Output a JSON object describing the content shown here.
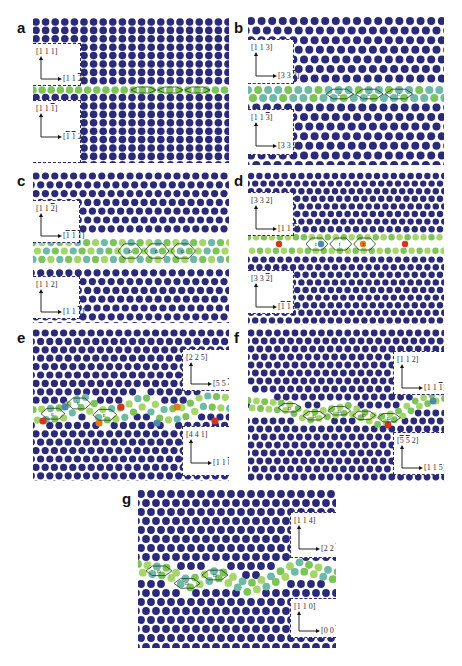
{
  "figure": {
    "colors": {
      "bulk_atom": "#2a2a78",
      "boundary_green": "#7cc35a",
      "boundary_lightgreen": "#a6d66a",
      "boundary_teal": "#6fb9a8",
      "boundary_blue": "#4f86b8",
      "boundary_red": "#d8341f",
      "boundary_orange": "#e07a1c",
      "unit_outline": "#1d3b1a",
      "box_border": "#2b2a6e",
      "background": "#ffffff"
    },
    "panels": [
      {
        "id": "a",
        "letter": "a",
        "rect": {
          "x": 33,
          "y": 18,
          "w": 196,
          "h": 145
        },
        "letter_pos": {
          "x": 17,
          "y": 20
        },
        "lattice": {
          "dx": 9.6,
          "dy": 8.4,
          "r": 3.8,
          "stagger": false,
          "angle": 0
        },
        "band": {
          "points": [
            [
              0,
              72
            ],
            [
              196,
              72
            ]
          ],
          "width": 8,
          "rows": 1,
          "palette": [
            "boundary_green"
          ],
          "accents": []
        },
        "units": {
          "count": 3,
          "start": 98,
          "label": ""
        },
        "boxes": [
          {
            "x": 0,
            "y": 25,
            "w": 48,
            "h": 43,
            "pos": "left",
            "y_label": "[1 1 1]",
            "x_label_parts": [
              "[1 1 ",
              "2",
              "]"
            ],
            "x_bar": [
              1
            ]
          },
          {
            "x": 0,
            "y": 82,
            "w": 48,
            "h": 63,
            "pos": "left",
            "y_label_parts": [
              "[1 1 ",
              "1",
              "]"
            ],
            "y_bar": [
              1
            ],
            "x_label_parts": [
              "[",
              "1",
              " ",
              "1",
              " 2]"
            ],
            "x_bar": [
              1,
              3
            ]
          }
        ]
      },
      {
        "id": "b",
        "letter": "b",
        "rect": {
          "x": 248,
          "y": 17,
          "w": 196,
          "h": 148
        },
        "letter_pos": {
          "x": 234,
          "y": 20
        },
        "lattice": {
          "dx": 10.6,
          "dy": 9.6,
          "r": 4.0,
          "stagger": true,
          "angle": 0
        },
        "band": {
          "points": [
            [
              0,
              77
            ],
            [
              196,
              77
            ]
          ],
          "width": 16,
          "rows": 2,
          "palette": [
            "boundary_teal",
            "boundary_green",
            "boundary_teal"
          ],
          "accents": []
        },
        "units": {
          "count": 3,
          "start": 78,
          "label": "C"
        },
        "boxes": [
          {
            "x": 0,
            "y": 22,
            "w": 46,
            "h": 45,
            "pos": "left",
            "y_label": "[1 1 3]",
            "x_label_parts": [
              "[3 3 ",
              "2",
              "]"
            ],
            "x_bar": [
              1
            ]
          },
          {
            "x": 0,
            "y": 92,
            "w": 46,
            "h": 46,
            "pos": "left",
            "y_label_parts": [
              "[1 1 ",
              "3",
              "]"
            ],
            "y_bar": [
              1
            ],
            "x_label": "[3 3 2]"
          }
        ]
      },
      {
        "id": "c",
        "letter": "c",
        "rect": {
          "x": 33,
          "y": 172,
          "w": 196,
          "h": 151
        },
        "letter_pos": {
          "x": 17,
          "y": 173
        },
        "lattice": {
          "dx": 9.4,
          "dy": 8.8,
          "r": 3.6,
          "stagger": true,
          "angle": 0
        },
        "band": {
          "points": [
            [
              0,
              79
            ],
            [
              196,
              79
            ]
          ],
          "width": 24,
          "rows": 3,
          "palette": [
            "boundary_green",
            "boundary_lightgreen",
            "boundary_teal"
          ],
          "accents": []
        },
        "units": {
          "count": 3,
          "start": 85,
          "label": "D"
        },
        "boxes": [
          {
            "x": 0,
            "y": 28,
            "w": 47,
            "h": 43,
            "pos": "left",
            "y_label_parts": [
              "[1 1 ",
              "2",
              "]"
            ],
            "y_bar": [
              1
            ],
            "x_label_parts": [
              "[",
              "1",
              " ",
              "1",
              " ",
              "1",
              "]"
            ],
            "x_bar": [
              1,
              3,
              5
            ]
          },
          {
            "x": 0,
            "y": 104,
            "w": 47,
            "h": 43,
            "pos": "left",
            "y_label": "[1 1 2]",
            "x_label_parts": [
              "[1 1 ",
              "1",
              "]"
            ],
            "x_bar": [
              1
            ]
          }
        ]
      },
      {
        "id": "d",
        "letter": "d",
        "rect": {
          "x": 248,
          "y": 172,
          "w": 196,
          "h": 153
        },
        "letter_pos": {
          "x": 234,
          "y": 173
        },
        "lattice": {
          "dx": 8.4,
          "dy": 7.6,
          "r": 3.2,
          "stagger": true,
          "angle": 0
        },
        "band": {
          "points": [
            [
              0,
              72
            ],
            [
              196,
              72
            ]
          ],
          "width": 20,
          "rows": 2,
          "palette": [
            "boundary_green",
            "boundary_lightgreen"
          ],
          "accents": [
            [
              31,
              72
            ],
            [
              73,
              72
            ],
            [
              115,
              72
            ],
            [
              157,
              72
            ]
          ]
        },
        "units": {
          "count": 3,
          "start": 58,
          "label": "I"
        },
        "boxes": [
          {
            "x": 0,
            "y": 20,
            "w": 46,
            "h": 44,
            "pos": "left",
            "y_label": "[3 3 2]",
            "x_label_parts": [
              "[1 1 ",
              "3",
              "]"
            ],
            "x_bar": [
              1
            ]
          },
          {
            "x": 0,
            "y": 98,
            "w": 46,
            "h": 44,
            "pos": "left",
            "y_label_parts": [
              "[3 3 ",
              "2",
              "]"
            ],
            "y_bar": [
              1
            ],
            "x_label_parts": [
              "[",
              "1",
              " ",
              "1",
              " 3]"
            ],
            "x_bar": [
              1,
              3
            ]
          }
        ]
      },
      {
        "id": "e",
        "letter": "e",
        "rect": {
          "x": 33,
          "y": 329,
          "w": 196,
          "h": 152
        },
        "letter_pos": {
          "x": 17,
          "y": 330
        },
        "lattice": {
          "dx": 9.2,
          "dy": 8.4,
          "r": 3.6,
          "stagger": true,
          "angle": 0
        },
        "band": {
          "points": [
            [
              0,
              86
            ],
            [
              30,
              84
            ],
            [
              50,
              72
            ],
            [
              70,
              86
            ],
            [
              90,
              84
            ],
            [
              110,
              72
            ],
            [
              130,
              86
            ],
            [
              150,
              84
            ],
            [
              170,
              72
            ],
            [
              196,
              74
            ]
          ],
          "width": 18,
          "rows": 2,
          "palette": [
            "boundary_green",
            "boundary_lightgreen",
            "boundary_teal"
          ],
          "accents": [
            [
              10,
              92
            ],
            [
              32,
              78
            ],
            [
              66,
              94
            ],
            [
              88,
              78
            ],
            [
              124,
              94
            ],
            [
              144,
              78
            ],
            [
              182,
              92
            ]
          ]
        },
        "units": {
          "count": 3,
          "start": 8,
          "label": "E"
        },
        "boxes": [
          {
            "x": 149,
            "y": 20,
            "w": 47,
            "h": 42,
            "pos": "right",
            "y_label": "[2 2 5]",
            "x_label_parts": [
              "[5 5 ",
              "4",
              "]"
            ],
            "x_bar": [
              1
            ]
          },
          {
            "x": 149,
            "y": 97,
            "w": 47,
            "h": 50,
            "pos": "right",
            "y_label": "[4 4 1]",
            "x_label_parts": [
              "[1 1 ",
              "8",
              "]"
            ],
            "x_bar": [
              1
            ]
          }
        ]
      },
      {
        "id": "f",
        "letter": "f",
        "rect": {
          "x": 248,
          "y": 329,
          "w": 196,
          "h": 152
        },
        "letter_pos": {
          "x": 234,
          "y": 330
        },
        "lattice": {
          "dx": 8.8,
          "dy": 8.0,
          "r": 3.4,
          "stagger": true,
          "angle": 0
        },
        "band": {
          "points": [
            [
              0,
              75
            ],
            [
              40,
              78
            ],
            [
              60,
              88
            ],
            [
              100,
              80
            ],
            [
              130,
              92
            ],
            [
              150,
              86
            ],
            [
              170,
              74
            ],
            [
              196,
              66
            ]
          ],
          "width": 14,
          "rows": 2,
          "palette": [
            "boundary_green",
            "boundary_lightgreen"
          ],
          "accents": [
            [
              140,
              96
            ],
            [
              185,
              72
            ],
            [
              188,
              52
            ]
          ]
        },
        "units": {
          "count": 5,
          "start": 30,
          "label": "D"
        },
        "boxes": [
          {
            "x": 145,
            "y": 22,
            "w": 51,
            "h": 44,
            "pos": "right",
            "y_label": "[1 1 2]",
            "x_label_parts": [
              "[1 1 ",
              "1",
              "]"
            ],
            "x_bar": [
              1
            ]
          },
          {
            "x": 145,
            "y": 103,
            "w": 51,
            "h": 43,
            "pos": "right",
            "y_label_parts": [
              "[",
              "5",
              " ",
              "5",
              " 2]"
            ],
            "y_bar": [
              1,
              3
            ],
            "x_label": "[1 1 5]"
          }
        ]
      },
      {
        "id": "g",
        "letter": "g",
        "rect": {
          "x": 138,
          "y": 490,
          "w": 198,
          "h": 158
        },
        "letter_pos": {
          "x": 122,
          "y": 491
        },
        "lattice": {
          "dx": 10.0,
          "dy": 9.0,
          "r": 3.9,
          "stagger": true,
          "angle": 0
        },
        "band": {
          "points": [
            [
              0,
              78
            ],
            [
              30,
              82
            ],
            [
              50,
              94
            ],
            [
              80,
              84
            ],
            [
              110,
              98
            ],
            [
              130,
              92
            ],
            [
              160,
              76
            ],
            [
              198,
              86
            ]
          ],
          "width": 16,
          "rows": 2,
          "palette": [
            "boundary_green",
            "boundary_lightgreen",
            "boundary_teal"
          ],
          "accents": []
        },
        "units": {
          "count": 3,
          "start": 8,
          "label": "D"
        },
        "boxes": [
          {
            "x": 152,
            "y": 22,
            "w": 46,
            "h": 46,
            "pos": "right",
            "y_label": "[1 1 4]",
            "x_label_parts": [
              "[2 2 ",
              "1",
              "]"
            ],
            "x_bar": [
              1
            ]
          },
          {
            "x": 152,
            "y": 108,
            "w": 46,
            "h": 40,
            "pos": "right",
            "y_label": "[1 1 0]",
            "x_label_parts": [
              "[0 0 ",
              "1",
              "]"
            ],
            "x_bar": [
              1
            ]
          }
        ]
      }
    ]
  }
}
